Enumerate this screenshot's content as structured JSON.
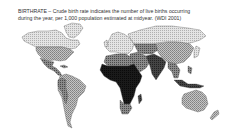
{
  "caption": {
    "line1": "BIRTHRATE – Crude birth rate indicates the number of live births occurring",
    "line2": "during the year, per 1,000 population estimated at midyear. (WDI 2001)"
  },
  "map": {
    "title": "BIRTHRATE",
    "source": "WDI 2001",
    "legend_classes": [
      {
        "name": "lowest",
        "fill": "#e8e8e8",
        "pattern": "light-hatch"
      },
      {
        "name": "low",
        "fill": "#b8b8b8",
        "pattern": "mid-hatch"
      },
      {
        "name": "medium",
        "fill": "#7a7a7a",
        "pattern": "dark-hatch"
      },
      {
        "name": "high",
        "fill": "#3a3a3a",
        "pattern": "dense"
      },
      {
        "name": "highest",
        "fill": "#111111",
        "pattern": "solid"
      }
    ],
    "regions": [
      {
        "name": "north-america-north",
        "class": "lowest"
      },
      {
        "name": "united-states",
        "class": "low"
      },
      {
        "name": "mexico-central-america",
        "class": "medium"
      },
      {
        "name": "south-america",
        "class": "low"
      },
      {
        "name": "andes",
        "class": "medium"
      },
      {
        "name": "europe",
        "class": "lowest"
      },
      {
        "name": "russia",
        "class": "lowest"
      },
      {
        "name": "north-africa",
        "class": "medium"
      },
      {
        "name": "sub-saharan-africa",
        "class": "highest"
      },
      {
        "name": "southern-africa",
        "class": "medium"
      },
      {
        "name": "middle-east",
        "class": "medium"
      },
      {
        "name": "central-asia",
        "class": "medium"
      },
      {
        "name": "south-asia",
        "class": "high"
      },
      {
        "name": "china",
        "class": "low"
      },
      {
        "name": "southeast-asia",
        "class": "medium"
      },
      {
        "name": "australia",
        "class": "low"
      },
      {
        "name": "greenland",
        "class": "lowest"
      }
    ]
  }
}
